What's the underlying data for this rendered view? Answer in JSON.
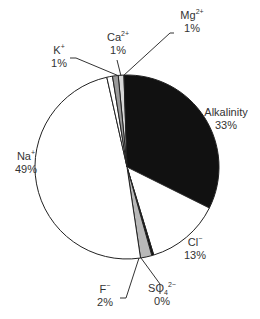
{
  "chart_data": {
    "type": "pie",
    "title": "",
    "slices": [
      {
        "label": "Mg2+",
        "display": "Mg",
        "sup": "2+",
        "sub": "",
        "value": 1,
        "pct_label": "1%",
        "color": "#d8d8d8"
      },
      {
        "label": "Alkalinity",
        "display": "Alkalinity",
        "sup": "",
        "sub": "",
        "value": 33,
        "pct_label": "33%",
        "color": "#111111"
      },
      {
        "label": "Cl-",
        "display": "Cl",
        "sup": "−",
        "sub": "",
        "value": 13,
        "pct_label": "13%",
        "color": "#ffffff"
      },
      {
        "label": "SO4 2-",
        "display": "SO",
        "sup": "2−",
        "sub": "4",
        "value": 0,
        "pct_label": "0%",
        "color": "#111111"
      },
      {
        "label": "F-",
        "display": "F",
        "sup": "−",
        "sub": "",
        "value": 2,
        "pct_label": "2%",
        "color": "#b8b8b8"
      },
      {
        "label": "Na+",
        "display": "Na",
        "sup": "+",
        "sub": "",
        "value": 49,
        "pct_label": "49%",
        "color": "#ffffff"
      },
      {
        "label": "K+",
        "display": "K",
        "sup": "+",
        "sub": "",
        "value": 1,
        "pct_label": "1%",
        "color": "#ffffff"
      },
      {
        "label": "Ca2+",
        "display": "Ca",
        "sup": "2+",
        "sub": "",
        "value": 1,
        "pct_label": "1%",
        "color": "#9a9a9a"
      }
    ],
    "legend": "none (callout labels)"
  },
  "labels": {
    "mg": {
      "name": "Mg",
      "sup": "2+",
      "pct": "1%"
    },
    "ca": {
      "name": "Ca",
      "sup": "2+",
      "pct": "1%"
    },
    "k": {
      "name": "K",
      "sup": "+",
      "pct": "1%"
    },
    "alk": {
      "name": "Alkalinity",
      "pct": "33%"
    },
    "na": {
      "name": "Na",
      "sup": "+",
      "pct": "49%"
    },
    "cl": {
      "name": "Cl",
      "sup": "−",
      "pct": "13%"
    },
    "f": {
      "name": "F",
      "sup": "−",
      "pct": "2%"
    },
    "so4": {
      "name": "SO",
      "sub": "4",
      "sup": "2−",
      "pct": "0%"
    }
  }
}
